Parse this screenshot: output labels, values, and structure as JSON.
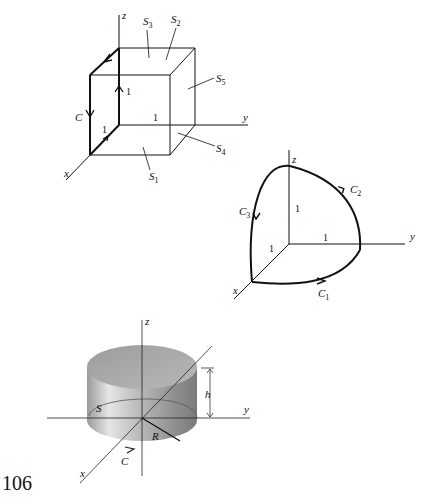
{
  "figure_cube": {
    "axes": {
      "x": "x",
      "y": "y",
      "z": "z"
    },
    "surfaces": [
      "S1",
      "S2",
      "S3",
      "S4",
      "S5"
    ],
    "surface_labels": {
      "S1": "S",
      "S2": "S",
      "S3": "S",
      "S4": "S",
      "S5": "S"
    },
    "surface_subs": {
      "S1": "1",
      "S2": "2",
      "S3": "3",
      "S4": "4",
      "S5": "5"
    },
    "curve": "C",
    "unit_labels": {
      "x": "1",
      "y": "1",
      "z": "1"
    }
  },
  "figure_quarter_sphere": {
    "axes": {
      "x": "x",
      "y": "y",
      "z": "z"
    },
    "curves": {
      "c1": "C",
      "c1_sub": "1",
      "c2": "C",
      "c2_sub": "2",
      "c3": "C",
      "c3_sub": "3"
    },
    "unit_labels": {
      "x": "1",
      "y": "1",
      "z": "1"
    }
  },
  "figure_cylinder": {
    "axes": {
      "x": "x",
      "y": "y",
      "z": "z"
    },
    "surface": "S",
    "curve": "C",
    "radius": "R",
    "height": "h"
  },
  "page_number": "106"
}
